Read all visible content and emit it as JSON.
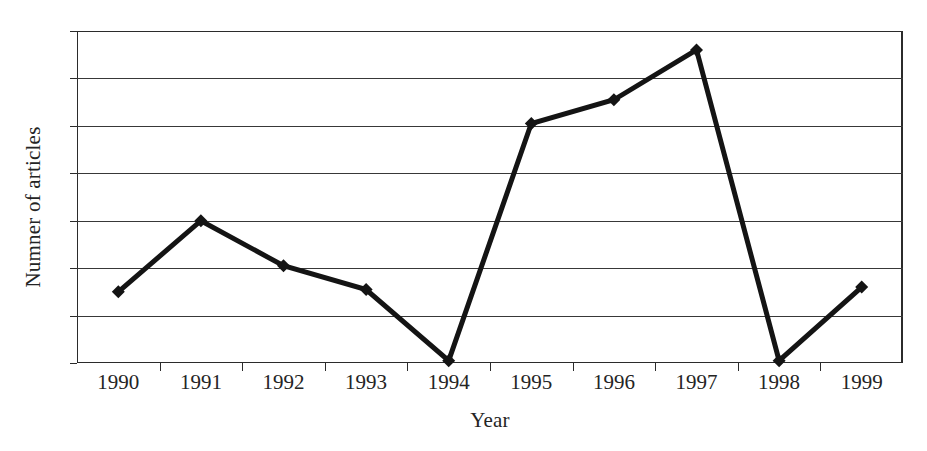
{
  "chart_data": {
    "type": "line",
    "title": "",
    "xlabel": "Year",
    "ylabel": "Numner of articles",
    "categories": [
      "1990",
      "1991",
      "1992",
      "1993",
      "1994",
      "1995",
      "1996",
      "1997",
      "1998",
      "1999"
    ],
    "values": [
      3.0,
      6.0,
      4.1,
      3.1,
      0.1,
      10.1,
      11.1,
      13.2,
      0.1,
      3.2
    ],
    "series": [
      {
        "name": "Number of articles",
        "values": [
          3.0,
          6.0,
          4.1,
          3.1,
          0.1,
          10.1,
          11.1,
          13.2,
          0.1,
          3.2
        ]
      }
    ],
    "ylim": [
      0,
      14
    ],
    "y_ticks": [
      0,
      2,
      4,
      6,
      8,
      10,
      12,
      14
    ],
    "y_tick_labels": [
      "0",
      "2",
      "4",
      "6",
      "8",
      "10",
      "12",
      "14"
    ],
    "grid": "horizontal",
    "legend": "none",
    "marker": "diamond",
    "line_color": "#141414",
    "marker_color": "#141414",
    "axis_color": "#2b2b2b",
    "background_color": "#ffffff"
  }
}
